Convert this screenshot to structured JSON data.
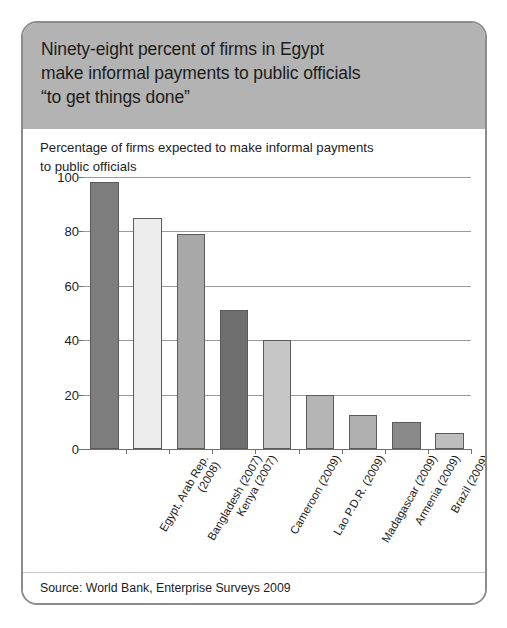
{
  "card": {
    "header": {
      "title_lines": [
        "Ninety-eight percent of firms in Egypt",
        "make informal payments to public officials",
        "“to get things done”"
      ],
      "background_color": "#b3b3b3"
    },
    "source_note": "Source: World Bank, Enterprise Surveys 2009"
  },
  "chart_data": {
    "type": "bar",
    "title": "Percentage of firms expected to make informal payments to public officials",
    "title_lines": [
      "Percentage of firms expected to make informal payments",
      "to public officials"
    ],
    "xlabel": "",
    "ylabel": "",
    "ylim": [
      0,
      100
    ],
    "yticks": [
      0,
      20,
      40,
      60,
      80,
      100
    ],
    "ytick_labels": [
      "0",
      "20",
      "40",
      "60",
      "80",
      "100"
    ],
    "grid": true,
    "legend": "none",
    "categories": [
      "Egypt, Arab Rep. (2008)",
      "Bangladesh (2007)",
      "Kenya (2007)",
      "Cameroon (2009)",
      "Lao P.D.R. (2009)",
      "Madagascar (2009)",
      "Armenia (2009)",
      "Brazil (2009)",
      "Poland (2009)"
    ],
    "category_lines": [
      [
        "Egypt, Arab Rep.",
        "(2008)"
      ],
      [
        "Bangladesh (2007)"
      ],
      [
        "Kenya (2007)"
      ],
      [
        "Cameroon (2009)"
      ],
      [
        "Lao P.D.R. (2009)"
      ],
      [
        "Madagascar (2009)"
      ],
      [
        "Armenia (2009)"
      ],
      [
        "Brazil (2009)"
      ],
      [
        "Poland (2009)"
      ]
    ],
    "values": [
      98,
      85,
      79,
      51,
      40,
      20,
      12.5,
      10,
      6
    ],
    "bar_colors": [
      "#7d7d7d",
      "#ededed",
      "#a8a8a8",
      "#6e6e6e",
      "#c6c6c6",
      "#b5b5b5",
      "#b0b0b0",
      "#8a8a8a",
      "#bdbdbd"
    ]
  }
}
